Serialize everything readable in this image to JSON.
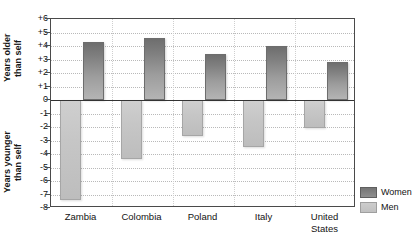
{
  "chart_data": {
    "type": "bar",
    "title": "",
    "subtitle": "",
    "xlabel": "",
    "ylabel": "",
    "ylim": [
      -8,
      6
    ],
    "grid": true,
    "legend_position": "right-bottom",
    "orientation": "vertical-diverging",
    "categories": [
      "Zambia",
      "Colombia",
      "Poland",
      "Italy",
      "United\nStates"
    ],
    "y_axis_upper_label": "Years older\nthan self",
    "y_axis_lower_label": "Years younger\nthan self",
    "y_ticks": [
      "+6",
      "+5",
      "+4",
      "+3",
      "+2",
      "+1",
      "0",
      "-1",
      "-2",
      "-3",
      "-4",
      "-5",
      "-6",
      "-7",
      "-8"
    ],
    "y_tick_values": [
      6,
      5,
      4,
      3,
      2,
      1,
      0,
      -1,
      -2,
      -3,
      -4,
      -5,
      -6,
      -7,
      -8
    ],
    "series": [
      {
        "name": "Women",
        "color": "#808080",
        "values": [
          4.3,
          4.6,
          3.4,
          4.0,
          2.8
        ]
      },
      {
        "name": "Men",
        "color": "#c6c6c6",
        "values": [
          -7.4,
          -4.4,
          -2.7,
          -3.5,
          -2.1
        ]
      }
    ]
  },
  "legend": {
    "items": [
      {
        "label": "Women",
        "swatch": "women"
      },
      {
        "label": "Men",
        "swatch": "men"
      }
    ]
  }
}
